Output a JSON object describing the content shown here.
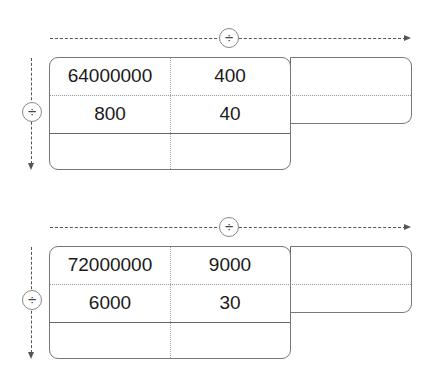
{
  "operator_symbol": "÷",
  "tables": [
    {
      "row1": [
        "64000000",
        "400",
        ""
      ],
      "row2": [
        "800",
        "40",
        ""
      ],
      "row3": [
        "",
        ""
      ],
      "horizontal_operator": "÷",
      "vertical_operator": "÷"
    },
    {
      "row1": [
        "72000000",
        "9000",
        ""
      ],
      "row2": [
        "6000",
        "30",
        ""
      ],
      "row3": [
        "",
        ""
      ],
      "horizontal_operator": "÷",
      "vertical_operator": "÷"
    }
  ]
}
